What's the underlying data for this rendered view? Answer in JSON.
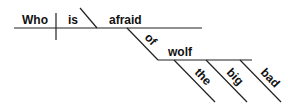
{
  "diagram": {
    "type": "sentence-diagram",
    "sentence": "Who is afraid of the big bad wolf",
    "words": {
      "subject": "Who",
      "verb": "is",
      "predicate_adjective": "afraid",
      "preposition": "of",
      "object": "wolf",
      "modifiers": [
        "the",
        "big",
        "bad"
      ]
    },
    "line_color": "#222222",
    "text_color": "#111111"
  }
}
